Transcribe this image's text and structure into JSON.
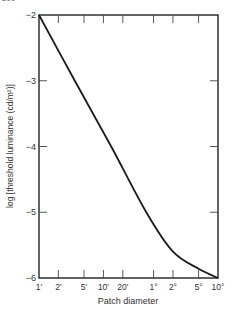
{
  "page": {
    "number_fragment": "200"
  },
  "chart_data": {
    "type": "line",
    "title": "",
    "xlabel": "Patch diameter",
    "ylabel": "log [threshold luminance (cd/m²)]",
    "x_scale": "log",
    "x_ticks": [
      "1'",
      "2'",
      "5'",
      "10'",
      "20'",
      "1°",
      "2°",
      "5°",
      "10°"
    ],
    "x_tick_values_deg": [
      0.01667,
      0.03333,
      0.08333,
      0.16667,
      0.33333,
      1,
      2,
      5,
      10
    ],
    "y_ticks": [
      "-2",
      "-3",
      "-4",
      "-5",
      "-6"
    ],
    "y_tick_values": [
      -2,
      -3,
      -4,
      -5,
      -6
    ],
    "ylim": [
      -6,
      -2
    ],
    "xlim_deg": [
      0.01667,
      10
    ],
    "grid": false,
    "legend": null,
    "series": [
      {
        "name": "threshold",
        "x_deg": [
          0.01667,
          0.06,
          0.22,
          0.77,
          2,
          5,
          10
        ],
        "y": [
          -2.0,
          -3.0,
          -4.0,
          -5.0,
          -5.6,
          -5.86,
          -6.0
        ]
      }
    ]
  }
}
